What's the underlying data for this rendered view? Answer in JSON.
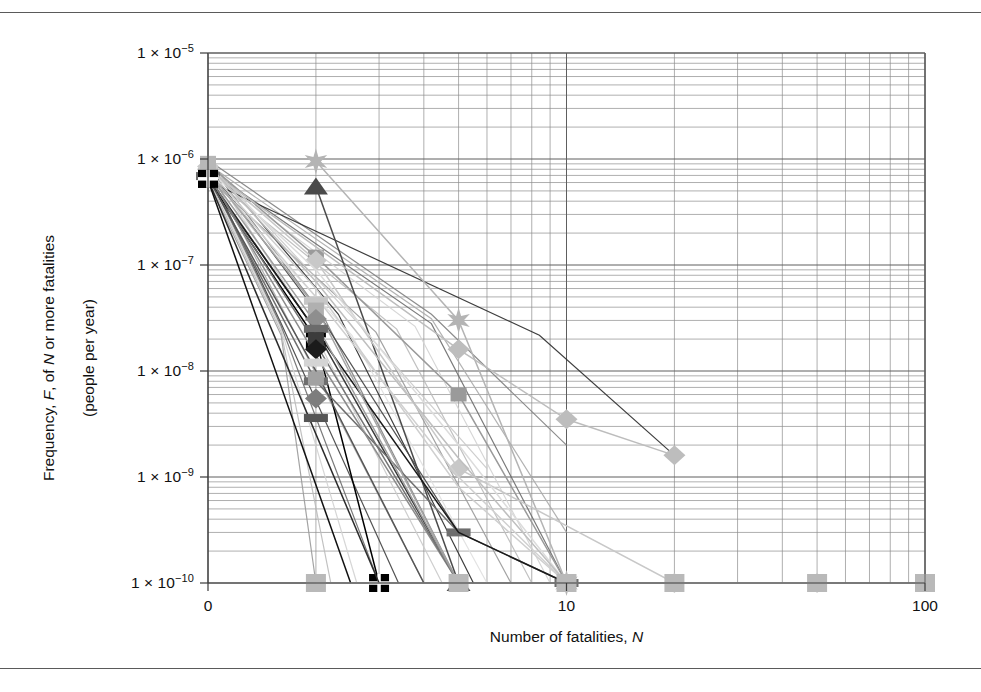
{
  "figure": {
    "kind": "fn-curve-log-log-scatter-line",
    "background": "#ffffff",
    "border_color": "#5a5a5a"
  },
  "chart_data": {
    "type": "line",
    "title": "",
    "subtitle": "",
    "xlabel_text_1": "Number of fatalities, ",
    "xlabel_italic": "N",
    "ylabel_line1_a": "Frequency, ",
    "ylabel_line1_b": "F",
    "ylabel_line1_c": ", of ",
    "ylabel_line1_d": "N",
    "ylabel_line1_e": " or more fatalities",
    "ylabel_line2": "(people per year)",
    "xscale": "log",
    "yscale": "log",
    "xlim": [
      1,
      100
    ],
    "ylim": [
      1e-10,
      1e-05
    ],
    "grid": "major-and-minor",
    "legend": "none",
    "xticks": [
      1,
      10,
      100
    ],
    "xticklabels": [
      "0",
      "10",
      "100"
    ],
    "yticks": [
      1e-05,
      1e-06,
      1e-07,
      1e-08,
      1e-09,
      1e-10
    ],
    "yticklabels": [
      "1 × 10−5",
      "1 × 10−6",
      "1 × 10−7",
      "1 × 10−8",
      "1 × 10−9",
      "1 × 10−10"
    ],
    "yticklabel_mantissa": "1 × 10",
    "yexponents": [
      "−5",
      "−6",
      "−7",
      "−8",
      "−9",
      "−10"
    ],
    "series": [
      {
        "name": "curve-01",
        "color": "#9a9a9a",
        "marker": "square",
        "x": [
          1,
          2,
          5,
          10
        ],
        "y": [
          9e-07,
          1.2e-07,
          6e-09,
          1e-10
        ]
      },
      {
        "name": "curve-02",
        "color": "#000000",
        "marker": "square-cross",
        "x": [
          1,
          2,
          3
        ],
        "y": [
          6.5e-07,
          2e-08,
          1e-10
        ]
      },
      {
        "name": "curve-03",
        "color": "#b4b4b4",
        "marker": "star",
        "x": [
          2,
          5,
          10
        ],
        "y": [
          9.5e-07,
          3e-08,
          1e-10
        ]
      },
      {
        "name": "curve-04",
        "color": "#4a4a4a",
        "marker": "triangle",
        "x": [
          2,
          5
        ],
        "y": [
          5.5e-07,
          1e-10
        ]
      },
      {
        "name": "curve-05",
        "color": "#bdbdbd",
        "marker": "diamond",
        "x": [
          1,
          5,
          10,
          20
        ],
        "y": [
          8e-07,
          1.6e-08,
          3.5e-09,
          1.6e-09
        ]
      },
      {
        "name": "curve-06",
        "color": "#c8c8c8",
        "marker": "diamond",
        "x": [
          1,
          2,
          5,
          20,
          50
        ],
        "y": [
          8.5e-07,
          1.1e-07,
          1.2e-09,
          1e-10,
          1e-10
        ]
      },
      {
        "name": "curve-07",
        "color": "#3a3a3a",
        "marker": "none",
        "x": [
          1,
          2,
          5
        ],
        "y": [
          6.8e-07,
          2.4e-08,
          1e-10
        ]
      },
      {
        "name": "curve-08",
        "color": "#6e6e6e",
        "marker": "bar",
        "x": [
          1,
          2,
          5,
          10
        ],
        "y": [
          6.9e-07,
          8e-09,
          3e-10,
          1e-10
        ]
      },
      {
        "name": "curve-09",
        "color": "#d0d0d0",
        "marker": "none",
        "x": [
          1,
          2,
          5,
          10
        ],
        "y": [
          7.5e-07,
          5e-08,
          1e-09,
          1e-10
        ]
      },
      {
        "name": "curve-10",
        "color": "#1a1a1a",
        "marker": "none",
        "x": [
          1,
          5,
          10
        ],
        "y": [
          6.6e-07,
          3e-10,
          1e-10
        ]
      },
      {
        "name": "curve-11",
        "color": "#8c8c8c",
        "marker": "none",
        "x": [
          1,
          2,
          5
        ],
        "y": [
          7.2e-07,
          1.4e-08,
          1e-10
        ]
      },
      {
        "name": "curve-12",
        "color": "#a6a6a6",
        "marker": "none",
        "x": [
          1,
          2,
          5
        ],
        "y": [
          7.8e-07,
          4e-08,
          1e-10
        ]
      },
      {
        "name": "curve-13",
        "color": "#2a2a2a",
        "marker": "none",
        "x": [
          1,
          3
        ],
        "y": [
          6.4e-07,
          1e-10
        ]
      },
      {
        "name": "curve-14",
        "color": "#dcdcdc",
        "marker": "none",
        "x": [
          1,
          2,
          5,
          10
        ],
        "y": [
          8.2e-07,
          9e-08,
          2e-09,
          1e-10
        ]
      },
      {
        "name": "curve-15",
        "color": "#747474",
        "marker": "none",
        "x": [
          1,
          2,
          5
        ],
        "y": [
          7e-07,
          1.8e-08,
          1e-10
        ]
      },
      {
        "name": "curve-16",
        "color": "#bfbfbf",
        "marker": "none",
        "x": [
          1,
          2,
          5,
          10
        ],
        "y": [
          8.8e-07,
          7e-08,
          1.5e-09,
          1e-10
        ]
      },
      {
        "name": "curve-17",
        "color": "#555555",
        "marker": "none",
        "x": [
          1,
          2,
          4
        ],
        "y": [
          6.7e-07,
          1e-08,
          1e-10
        ]
      },
      {
        "name": "curve-18",
        "color": "#cfcfcf",
        "marker": "none",
        "x": [
          1,
          2,
          5,
          10
        ],
        "y": [
          7.9e-07,
          6e-08,
          8e-10,
          1e-10
        ]
      },
      {
        "name": "curve-19",
        "color": "#9e9e9e",
        "marker": "none",
        "x": [
          1,
          2,
          5
        ],
        "y": [
          7.4e-07,
          2.8e-08,
          1e-10
        ]
      },
      {
        "name": "curve-20",
        "color": "#101010",
        "marker": "none",
        "x": [
          1,
          2.5
        ],
        "y": [
          6.3e-07,
          1e-10
        ]
      }
    ],
    "marker_cluster_x_values": [
      1,
      2,
      5,
      10,
      20,
      50,
      100
    ],
    "baseline_markers_y": 1e-10,
    "baseline_marker_x": [
      2,
      5,
      10,
      20,
      50,
      100
    ]
  },
  "yaxis_labels": [
    {
      "text": "1 × 10",
      "sup": "−5",
      "value": 1e-05
    },
    {
      "text": "1 × 10",
      "sup": "−6",
      "value": 1e-06
    },
    {
      "text": "1 × 10",
      "sup": "−7",
      "value": 1e-07
    },
    {
      "text": "1 × 10",
      "sup": "−8",
      "value": 1e-08
    },
    {
      "text": "1 × 10",
      "sup": "−9",
      "value": 1e-09
    },
    {
      "text": "1 × 10",
      "sup": "−10",
      "value": 1e-10
    }
  ],
  "xaxis_labels": [
    {
      "text": "0",
      "value": 1
    },
    {
      "text": "10",
      "value": 10
    },
    {
      "text": "100",
      "value": 100
    }
  ]
}
